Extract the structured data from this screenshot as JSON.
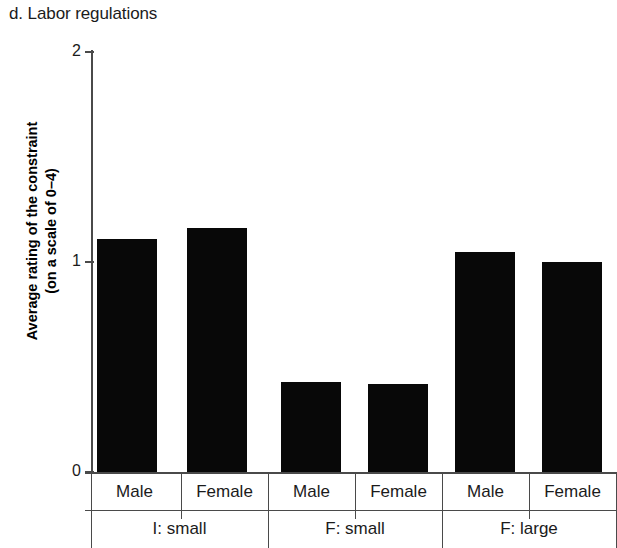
{
  "chart_data": {
    "type": "bar",
    "title": "d. Labor regulations",
    "xlabel": "",
    "ylabel": "Average rating of the constraint (on a scale of 0–4)",
    "ylabel_line1": "Average rating of the constraint",
    "ylabel_line2": "(on a scale of 0–4)",
    "ylim": [
      0,
      2
    ],
    "yticks": [
      0,
      1,
      2
    ],
    "ytick_labels": [
      "0",
      "1",
      "2"
    ],
    "grid": false,
    "legend": "none",
    "bar_color": "#080808",
    "axis_color": "#4a4a4a",
    "categories": [
      "Male",
      "Female",
      "Male",
      "Female",
      "Male",
      "Female"
    ],
    "values": [
      1.11,
      1.16,
      0.43,
      0.42,
      1.05,
      1.0
    ],
    "groups": [
      {
        "label": "I: small",
        "categories": [
          "Male",
          "Female"
        ],
        "values": [
          1.11,
          1.16
        ]
      },
      {
        "label": "F: small",
        "categories": [
          "Male",
          "Female"
        ],
        "values": [
          0.43,
          0.42
        ]
      },
      {
        "label": "F: large",
        "categories": [
          "Male",
          "Female"
        ],
        "values": [
          1.05,
          1.0
        ]
      }
    ],
    "group_labels": [
      "I: small",
      "F: small",
      "F: large"
    ]
  },
  "axis": {
    "ytick_0": "0",
    "ytick_1": "1",
    "ytick_2": "2"
  },
  "xaxis": {
    "sub_labels": [
      "Male",
      "Female",
      "Male",
      "Female",
      "Male",
      "Female"
    ],
    "group_labels": [
      "I: small",
      "F: small",
      "F: large"
    ]
  }
}
